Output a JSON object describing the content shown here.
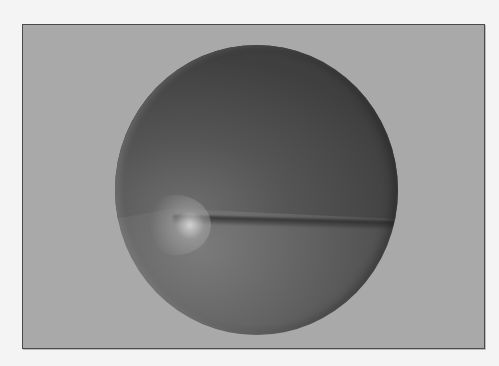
{
  "scene": {
    "description": "Rendered shaded sphere inside gray framed panel",
    "colors": {
      "page_background": "#f4f4f4",
      "panel_background": "#a9a9a9",
      "panel_border": "#4a4a4a",
      "sphere_upper": "#4a4a4a",
      "sphere_lower": "#676767",
      "highlight": "#d7d7d7"
    }
  }
}
